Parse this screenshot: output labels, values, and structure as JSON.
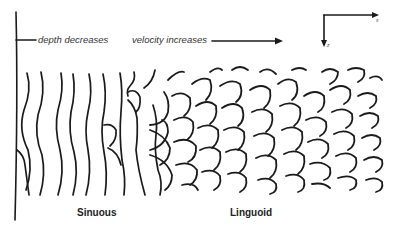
{
  "diagram": {
    "annotations": {
      "depth": "depth decreases",
      "velocity": "velocity increases"
    },
    "axes": {
      "x_label": "x",
      "z_label": "z"
    },
    "regions": [
      {
        "name": "Sinuous"
      },
      {
        "name": "Linguoid"
      }
    ],
    "colors": {
      "ink": "#1a1a1a",
      "background": "#ffffff"
    }
  }
}
